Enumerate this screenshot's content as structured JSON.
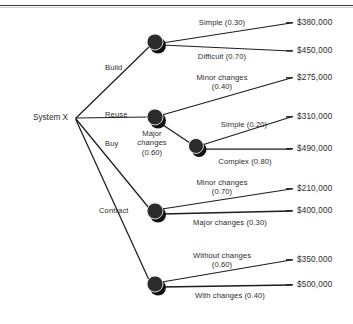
{
  "diagram": {
    "root": {
      "label": "System X",
      "x": 68,
      "y": 118
    },
    "colors": {
      "node_fill": "#2b2b2b",
      "node_shadow": "#111111",
      "edge": "#1d1d1d",
      "text": "#2b2b2b",
      "background": "#ffffff",
      "rule": "#3a3a3a"
    },
    "nodes": [
      {
        "id": "build",
        "x": 155,
        "y": 42,
        "r": 8
      },
      {
        "id": "reuse",
        "x": 155,
        "y": 117,
        "r": 8
      },
      {
        "id": "complex",
        "x": 196,
        "y": 146,
        "r": 7.5
      },
      {
        "id": "buy",
        "x": 155,
        "y": 211,
        "r": 8
      },
      {
        "id": "contract",
        "x": 155,
        "y": 284,
        "r": 8
      }
    ],
    "branches": [
      {
        "label": "Build",
        "x": 105,
        "y": 63
      },
      {
        "label": "Reuse",
        "x": 105,
        "y": 110
      },
      {
        "label": "Buy",
        "x": 105,
        "y": 139
      },
      {
        "label": "Contract",
        "x": 99,
        "y": 206
      }
    ],
    "outcome_labels": [
      {
        "line1": "Simple (0.30)",
        "line2": "",
        "x": 222,
        "y": 18,
        "align": "center"
      },
      {
        "line1": "Difficult (0.70)",
        "line2": "",
        "x": 222,
        "y": 52,
        "align": "center"
      },
      {
        "line1": "Minor changes",
        "line2": "(0.40)",
        "x": 222,
        "y": 73,
        "align": "center"
      },
      {
        "line1": "Major",
        "line2": "changes\n(0.60)",
        "x": 152,
        "y": 129,
        "align": "center"
      },
      {
        "line1": "Simple (0.20)",
        "line2": "",
        "x": 244,
        "y": 120,
        "align": "center"
      },
      {
        "line1": "Complex (0.80)",
        "line2": "",
        "x": 245,
        "y": 157,
        "align": "center"
      },
      {
        "line1": "Minor changes",
        "line2": "(0.70)",
        "x": 222,
        "y": 178,
        "align": "center"
      },
      {
        "line1": "Major changes (0.30)",
        "line2": "",
        "x": 230,
        "y": 218,
        "align": "center"
      },
      {
        "line1": "Without changes",
        "line2": "(0.60)",
        "x": 222,
        "y": 251,
        "align": "center"
      },
      {
        "line1": "With changes (0.40)",
        "line2": "",
        "x": 230,
        "y": 291,
        "align": "center"
      }
    ],
    "payoffs": [
      {
        "value": "$380,000",
        "x": 297,
        "y": 26
      },
      {
        "value": "$450,000",
        "x": 297,
        "y": 54
      },
      {
        "value": "$275,000",
        "x": 297,
        "y": 81
      },
      {
        "value": "$310,000",
        "x": 297,
        "y": 120
      },
      {
        "value": "$490,000",
        "x": 297,
        "y": 152
      },
      {
        "value": "$210,000",
        "x": 297,
        "y": 192
      },
      {
        "value": "$400,000",
        "x": 297,
        "y": 214
      },
      {
        "value": "$350,000",
        "x": 297,
        "y": 263
      },
      {
        "value": "$500,000",
        "x": 297,
        "y": 288
      }
    ],
    "chart_data": {
      "type": "diagram",
      "subtype": "decision-tree",
      "title": "System X decision tree",
      "root": "System X",
      "decisions": [
        {
          "name": "Build",
          "outcomes": [
            {
              "name": "Simple",
              "probability": 0.3,
              "payoff": 380000
            },
            {
              "name": "Difficult",
              "probability": 0.7,
              "payoff": 450000
            }
          ]
        },
        {
          "name": "Reuse",
          "outcomes": [
            {
              "name": "Minor changes",
              "probability": 0.4,
              "payoff": 275000
            },
            {
              "name": "Major changes",
              "probability": 0.6,
              "outcomes": [
                {
                  "name": "Simple",
                  "probability": 0.2,
                  "payoff": 310000
                },
                {
                  "name": "Complex",
                  "probability": 0.8,
                  "payoff": 490000
                }
              ]
            }
          ]
        },
        {
          "name": "Buy",
          "outcomes": [
            {
              "name": "Minor changes",
              "probability": 0.7,
              "payoff": 210000
            },
            {
              "name": "Major changes",
              "probability": 0.3,
              "payoff": 400000
            }
          ]
        },
        {
          "name": "Contract",
          "outcomes": [
            {
              "name": "Without changes",
              "probability": 0.6,
              "payoff": 350000
            },
            {
              "name": "With changes",
              "probability": 0.4,
              "payoff": 500000
            }
          ]
        }
      ]
    }
  }
}
